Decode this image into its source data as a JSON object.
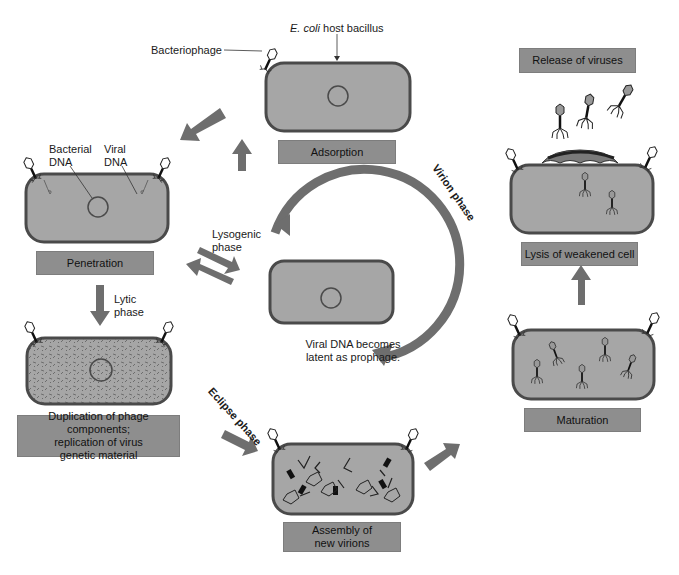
{
  "diagram": {
    "colors": {
      "cell_fill": "#a6a6a6",
      "cell_border": "#4a4a4a",
      "arrow": "#6e6e6e",
      "label_box": "#8e8e8e"
    },
    "annotations": {
      "host_prefix": "E. coli",
      "host_suffix": " host bacillus",
      "bacteriophage": "Bacteriophage",
      "bacterial_dna_line1": "Bacterial",
      "bacterial_dna_line2": "DNA",
      "viral_dna_line1": "Viral",
      "viral_dna_line2": "DNA",
      "lysogenic_line1": "Lysogenic",
      "lysogenic_line2": "phase",
      "lytic_line1": "Lytic",
      "lytic_line2": "phase",
      "prophage_line1": "Viral DNA becomes",
      "prophage_line2": "latent as prophage."
    },
    "phases": {
      "virion": "Virion phase",
      "eclipse": "Eclipse phase"
    },
    "stages": [
      {
        "id": "adsorption",
        "label": "Adsorption"
      },
      {
        "id": "penetration",
        "label": "Penetration"
      },
      {
        "id": "duplication",
        "label_line1": "Duplication of phage components;",
        "label_line2": "replication of virus",
        "label_line3": "genetic material"
      },
      {
        "id": "assembly",
        "label_line1": "Assembly of",
        "label_line2": "new virions"
      },
      {
        "id": "maturation",
        "label": "Maturation"
      },
      {
        "id": "lysis",
        "label": "Lysis of weakened cell"
      },
      {
        "id": "release",
        "label": "Release of viruses"
      }
    ]
  }
}
